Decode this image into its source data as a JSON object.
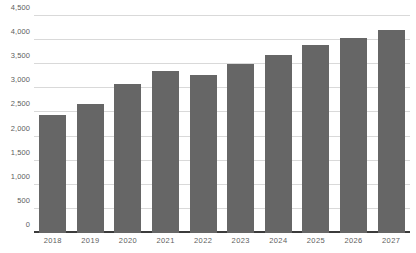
{
  "chart_data": {
    "type": "bar",
    "title": "",
    "subtitle": "",
    "xlabel": "",
    "ylabel": "",
    "categories": [
      "2018",
      "2019",
      "2020",
      "2021",
      "2022",
      "2023",
      "2024",
      "2025",
      "2026",
      "2027"
    ],
    "values": [
      2440,
      2670,
      3080,
      3350,
      3270,
      3510,
      3700,
      3890,
      4050,
      4210
    ],
    "ylim": [
      0,
      4500
    ],
    "y_ticks": [
      0,
      500,
      1000,
      1500,
      2000,
      2500,
      3000,
      3500,
      4000,
      4500
    ],
    "y_tick_labels": [
      "0",
      "500",
      "1,000",
      "1,500",
      "2,000",
      "2,500",
      "3,000",
      "3,500",
      "4,000",
      "4,500"
    ],
    "grid": true,
    "legend": null,
    "legend_position": "none",
    "colors": {
      "bar": "#666666",
      "gridline": "#d9d9d9",
      "axis_line": "#3b3b3b",
      "tick_label": "#5e5e5e",
      "background": "#ffffff"
    }
  }
}
